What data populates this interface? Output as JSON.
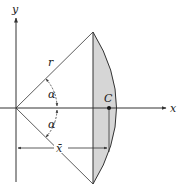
{
  "diagram": {
    "labels": {
      "y_axis": "y",
      "x_axis": "x",
      "radius": "r",
      "angle_upper": "α",
      "angle_lower": "α",
      "centroid": "C",
      "centroid_distance": "x̄"
    },
    "colors": {
      "stroke": "#333333",
      "segment_fill": "#d6d6d6",
      "background": "#ffffff"
    },
    "geometry": {
      "origin": [
        16,
        108
      ],
      "chord_top": [
        93,
        32
      ],
      "chord_bottom": [
        93,
        184
      ],
      "arc_rightmost": [
        126,
        108
      ],
      "centroid_point": [
        109,
        108
      ],
      "dimension_line_y": 148
    }
  }
}
